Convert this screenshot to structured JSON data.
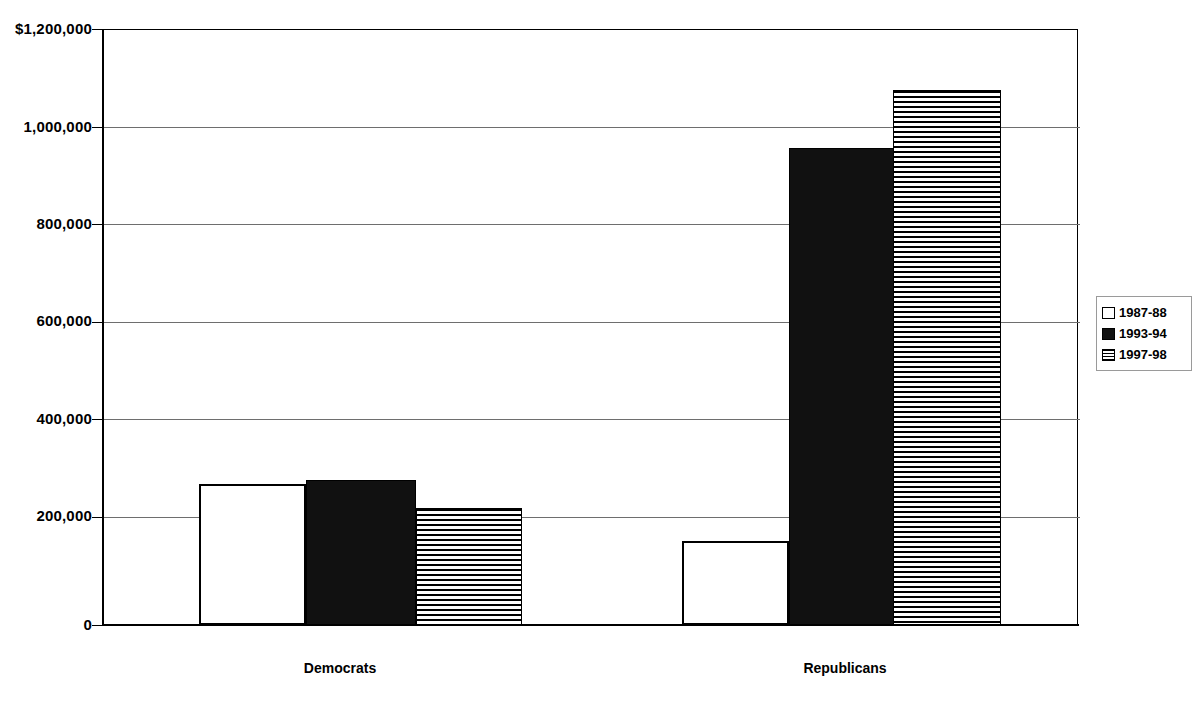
{
  "chart_data": {
    "type": "bar",
    "title": "",
    "subtitle": "",
    "xlabel": "",
    "ylabel": "",
    "categories": [
      "Democrats",
      "Republicans"
    ],
    "series": [
      {
        "name": "1987-88",
        "values": [
          285000,
          170000
        ],
        "fill": "white"
      },
      {
        "name": "1993-94",
        "values": [
          293000,
          962000
        ],
        "fill": "black"
      },
      {
        "name": "1997-98",
        "values": [
          235000,
          1078000
        ],
        "fill": "horizontal-stripes"
      }
    ],
    "ylim": [
      0,
      1200000
    ],
    "ytick_values": [
      0,
      200000,
      400000,
      600000,
      800000,
      1000000,
      1200000
    ],
    "ytick_labels": [
      "0",
      "200,000",
      "400,000",
      "600,000",
      "800,000",
      "1,000,000",
      "$1,200,000"
    ],
    "grid": true,
    "grid_axis": "y",
    "legend_position": "right",
    "colors": {
      "axis": "#000000",
      "grid": "#6e6e6e",
      "series_black": "#111111",
      "series_white": "#ffffff",
      "background": "#ffffff"
    }
  },
  "axis": {
    "ticks": [
      {
        "label": "$1,200,000",
        "value": 1200000
      },
      {
        "label": "1,000,000",
        "value": 1000000
      },
      {
        "label": "800,000",
        "value": 800000
      },
      {
        "label": "600,000",
        "value": 600000
      },
      {
        "label": "400,000",
        "value": 400000
      },
      {
        "label": "200,000",
        "value": 200000
      },
      {
        "label": "0",
        "value": 0
      }
    ]
  },
  "categories": [
    {
      "label": "Democrats"
    },
    {
      "label": "Republicans"
    }
  ],
  "legend": {
    "items": [
      {
        "label": "1987-88",
        "swatch": "white-square-icon"
      },
      {
        "label": "1993-94",
        "swatch": "black-square-icon"
      },
      {
        "label": "1997-98",
        "swatch": "striped-square-icon"
      }
    ]
  }
}
